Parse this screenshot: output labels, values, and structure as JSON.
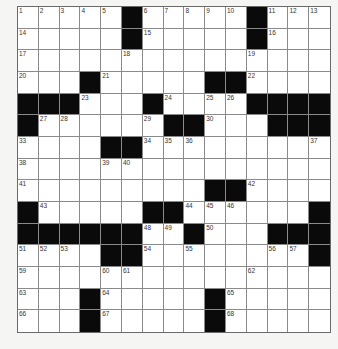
{
  "puzzle": {
    "rows": 15,
    "cols": 15,
    "layout": [
      "#####.#####.###",
      "#####.#####.###",
      "###############",
      "###.#####..####",
      "...###.####....",
      ".######..###...",
      "####..#########",
      "###############",
      "#########..####",
      ".#####..######.",
      "......##.###...",
      "####..########.",
      "###############",
      "###.#####.#####",
      "###.#####.#####"
    ],
    "black_legend": "'.' = black square, '#' = white square",
    "numbers": [
      {
        "r": 0,
        "c": 0,
        "n": "1"
      },
      {
        "r": 0,
        "c": 1,
        "n": "2"
      },
      {
        "r": 0,
        "c": 2,
        "n": "3"
      },
      {
        "r": 0,
        "c": 3,
        "n": "4"
      },
      {
        "r": 0,
        "c": 4,
        "n": "5"
      },
      {
        "r": 0,
        "c": 6,
        "n": "6"
      },
      {
        "r": 0,
        "c": 7,
        "n": "7"
      },
      {
        "r": 0,
        "c": 8,
        "n": "8"
      },
      {
        "r": 0,
        "c": 9,
        "n": "9"
      },
      {
        "r": 0,
        "c": 10,
        "n": "10"
      },
      {
        "r": 0,
        "c": 12,
        "n": "11"
      },
      {
        "r": 0,
        "c": 13,
        "n": "12"
      },
      {
        "r": 0,
        "c": 14,
        "n": "13"
      },
      {
        "r": 1,
        "c": 0,
        "n": "14"
      },
      {
        "r": 1,
        "c": 6,
        "n": "15"
      },
      {
        "r": 1,
        "c": 12,
        "n": "16"
      },
      {
        "r": 2,
        "c": 0,
        "n": "17"
      },
      {
        "r": 2,
        "c": 5,
        "n": "18"
      },
      {
        "r": 2,
        "c": 11,
        "n": "19"
      },
      {
        "r": 3,
        "c": 0,
        "n": "20"
      },
      {
        "r": 3,
        "c": 4,
        "n": "21"
      },
      {
        "r": 3,
        "c": 11,
        "n": "22"
      },
      {
        "r": 4,
        "c": 3,
        "n": "23"
      },
      {
        "r": 4,
        "c": 7,
        "n": "24"
      },
      {
        "r": 4,
        "c": 9,
        "n": "25"
      },
      {
        "r": 4,
        "c": 10,
        "n": "26"
      },
      {
        "r": 5,
        "c": 1,
        "n": "27"
      },
      {
        "r": 5,
        "c": 2,
        "n": "28"
      },
      {
        "r": 5,
        "c": 6,
        "n": "29"
      },
      {
        "r": 5,
        "c": 9,
        "n": "30"
      },
      {
        "r": 5,
        "c": 12,
        "n": "31"
      },
      {
        "r": 5,
        "c": 13,
        "n": "32"
      },
      {
        "r": 6,
        "c": 0,
        "n": "33"
      },
      {
        "r": 6,
        "c": 6,
        "n": "34"
      },
      {
        "r": 6,
        "c": 7,
        "n": "35"
      },
      {
        "r": 6,
        "c": 8,
        "n": "36"
      },
      {
        "r": 6,
        "c": 14,
        "n": "37"
      },
      {
        "r": 7,
        "c": 0,
        "n": "38"
      },
      {
        "r": 7,
        "c": 4,
        "n": "39"
      },
      {
        "r": 7,
        "c": 5,
        "n": "40"
      },
      {
        "r": 8,
        "c": 0,
        "n": "41"
      },
      {
        "r": 8,
        "c": 11,
        "n": "42"
      },
      {
        "r": 9,
        "c": 1,
        "n": "43"
      },
      {
        "r": 9,
        "c": 8,
        "n": "44"
      },
      {
        "r": 9,
        "c": 9,
        "n": "45"
      },
      {
        "r": 9,
        "c": 10,
        "n": "46"
      },
      {
        "r": 10,
        "c": 3,
        "n": "47"
      },
      {
        "r": 10,
        "c": 6,
        "n": "48"
      },
      {
        "r": 10,
        "c": 7,
        "n": "49"
      },
      {
        "r": 10,
        "c": 9,
        "n": "50"
      },
      {
        "r": 11,
        "c": 0,
        "n": "51"
      },
      {
        "r": 11,
        "c": 1,
        "n": "52"
      },
      {
        "r": 11,
        "c": 2,
        "n": "53"
      },
      {
        "r": 11,
        "c": 6,
        "n": "54"
      },
      {
        "r": 11,
        "c": 8,
        "n": "55"
      },
      {
        "r": 11,
        "c": 12,
        "n": "56"
      },
      {
        "r": 11,
        "c": 13,
        "n": "57"
      },
      {
        "r": 11,
        "c": 14,
        "n": "58"
      },
      {
        "r": 12,
        "c": 0,
        "n": "59"
      },
      {
        "r": 12,
        "c": 4,
        "n": "60"
      },
      {
        "r": 12,
        "c": 5,
        "n": "61"
      },
      {
        "r": 12,
        "c": 11,
        "n": "62"
      },
      {
        "r": 13,
        "c": 0,
        "n": "63"
      },
      {
        "r": 13,
        "c": 4,
        "n": "64"
      },
      {
        "r": 13,
        "c": 10,
        "n": "65"
      },
      {
        "r": 14,
        "c": 0,
        "n": "66"
      },
      {
        "r": 14,
        "c": 4,
        "n": "67"
      },
      {
        "r": 14,
        "c": 10,
        "n": "68"
      }
    ]
  },
  "colors": {
    "black_square": "#0a0a0a",
    "white_square": "#ffffff",
    "grid_line": "#8a8a8a",
    "page_background": "#f5f5f4"
  }
}
